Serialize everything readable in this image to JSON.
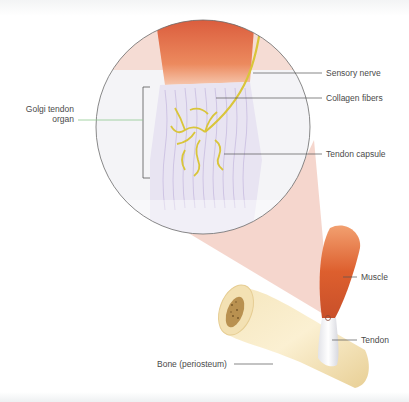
{
  "figure": {
    "labels": {
      "golgi_tendon_organ_line1": "Golgi tendon",
      "golgi_tendon_organ_line2": "organ",
      "sensory_nerve": "Sensory nerve",
      "collagen_fibers": "Collagen fibers",
      "tendon_capsule": "Tendon capsule",
      "muscle": "Muscle",
      "tendon": "Tendon",
      "bone": "Bone (periosteum)"
    },
    "colors": {
      "muscle": "#e0673a",
      "nerve": "#d8c23a",
      "collagen": "#b9a6d6",
      "magnify_cone": "#f2c9bd",
      "bone": "#f0dca8",
      "bone_marrow": "#a9803d",
      "leader_line": "#555555",
      "golgi_leader": "#8fc98f"
    }
  }
}
